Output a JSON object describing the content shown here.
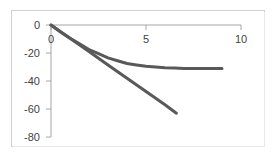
{
  "chart_data": {
    "type": "line",
    "title": "",
    "subtitle": "",
    "xlabel": "",
    "ylabel": "",
    "xlim": [
      0,
      10
    ],
    "ylim": [
      -80,
      0
    ],
    "xticks": [
      0,
      5,
      10
    ],
    "xtick_labels": [
      "0",
      "5",
      "10"
    ],
    "yticks": [
      0,
      -20,
      -40,
      -60,
      -80
    ],
    "ytick_labels": [
      "0",
      "-20",
      "-40",
      "-60",
      "-80"
    ],
    "grid": false,
    "legend": null,
    "axis_position": "x-axis at top (y=0), y-axis at left (x=0)",
    "series": [
      {
        "name": "linear",
        "style": "straight-line",
        "color": "#595959",
        "linewidth": 3,
        "x": [
          0,
          1,
          2,
          3,
          4,
          5,
          6,
          6.6
        ],
        "values": [
          0,
          -9.5,
          -19,
          -28.5,
          -38,
          -47.5,
          -57,
          -63
        ]
      },
      {
        "name": "asymptotic-curve",
        "style": "curve",
        "color": "#595959",
        "linewidth": 3,
        "x": [
          0,
          0.5,
          1,
          1.5,
          2,
          2.5,
          3,
          3.5,
          4,
          4.5,
          5,
          5.5,
          6,
          6.5,
          7,
          7.5,
          8,
          8.5,
          9
        ],
        "values": [
          0,
          -5,
          -9.5,
          -13.5,
          -17.5,
          -20.5,
          -23.5,
          -25.5,
          -27.5,
          -28.5,
          -29.5,
          -30,
          -30.5,
          -30.7,
          -31,
          -31,
          -31,
          -31,
          -31
        ]
      }
    ],
    "colors": {
      "series_line": "#595959",
      "axis": "#a6a6a6",
      "frame_border": "#d0d0d0",
      "tick_text": "#3f3f3f",
      "background": "#ffffff"
    }
  }
}
